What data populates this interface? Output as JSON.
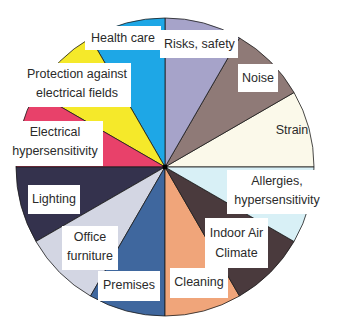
{
  "chart_data": {
    "type": "pie",
    "title": "",
    "start_angle_deg": 0,
    "direction": "counterclockwise",
    "categories": [
      "Strain",
      "Noise",
      "Risks, safety",
      "Health care",
      "Protection against electrical fields",
      "Electrical hypersensitivity",
      "Lighting",
      "Office furniture",
      "Premises",
      "Cleaning",
      "Indoor Air Climate",
      "Allergies, hypersensitivity"
    ],
    "values": [
      30,
      30,
      30,
      30,
      30,
      30,
      30,
      30,
      30,
      30,
      30,
      30
    ],
    "colors": [
      "#fbf9ea",
      "#8f7a77",
      "#a6a3c9",
      "#1ea7e6",
      "#f5e92a",
      "#e8416a",
      "#34324d",
      "#d3d6e3",
      "#3f679e",
      "#f0a57a",
      "#4a3a3d",
      "#d8f0f6"
    ],
    "legend": "none (labels placed on slices)",
    "grid": false
  },
  "labels": {
    "strain": "Strain",
    "noise": "Noise",
    "risks": "Risks, safety",
    "health": "Health care",
    "protection_1": "Protection against",
    "protection_2": "electrical fields",
    "electrical_1": "Electrical",
    "electrical_2": "hypersensitivity",
    "lighting": "Lighting",
    "office_1": "Office",
    "office_2": "furniture",
    "premises": "Premises",
    "cleaning": "Cleaning",
    "indoor_1": "Indoor Air",
    "indoor_2": "Climate",
    "allergies_1": "Allergies,",
    "allergies_2": "hypersensitivity"
  }
}
